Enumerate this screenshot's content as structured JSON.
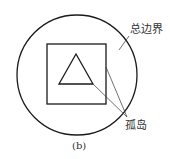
{
  "diagram": {
    "caption": "(b)",
    "labels": {
      "outer_boundary": "总边界",
      "island": "孤岛"
    },
    "colors": {
      "stroke": "#1a1a1a",
      "text": "#333333",
      "background": "#ffffff"
    },
    "shapes": [
      {
        "type": "circle",
        "role": "outer-boundary"
      },
      {
        "type": "square",
        "role": "island"
      },
      {
        "type": "triangle",
        "role": "island"
      }
    ]
  }
}
